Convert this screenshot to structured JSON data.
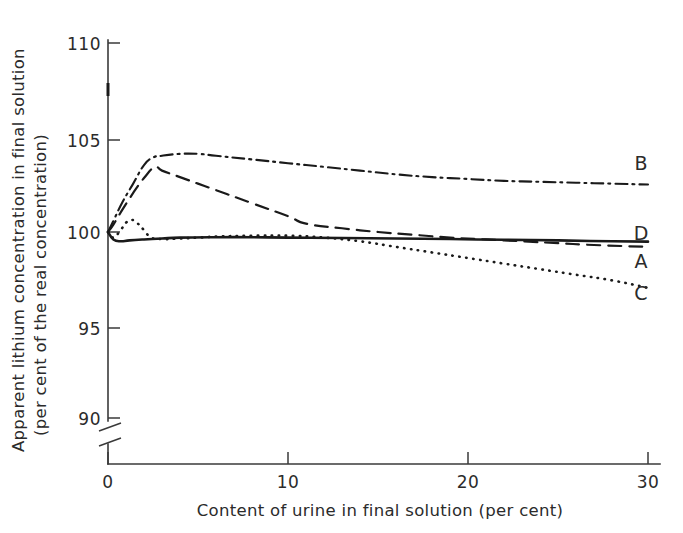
{
  "chart_data": {
    "type": "line",
    "title": "",
    "xlabel": "Content of urine in final solution (per cent)",
    "ylabel_line1": "Apparent lithium concentration in final solution",
    "ylabel_line2": "(per cent of the real concentration)",
    "xlim": [
      0,
      30
    ],
    "ylim": [
      90,
      110
    ],
    "xticks": [
      0,
      10,
      20,
      30
    ],
    "xticklabels": [
      "0",
      "10",
      "20",
      "30"
    ],
    "yticks": [
      90,
      95,
      100,
      105,
      110
    ],
    "yticklabels": [
      "90",
      "95",
      "100",
      "105",
      "110"
    ],
    "y_axis_break": true,
    "y_axis_break_note": "axis broken between 0 and 90",
    "grid": false,
    "legend_position": "right-inline-end-labels",
    "series": [
      {
        "name": "B",
        "label": "B",
        "style": "dash-dot",
        "label_value": 103.1,
        "x": [
          0,
          0.3,
          0.8,
          1.4,
          2.0,
          2.5,
          3.0,
          4.0,
          5.0,
          6.0,
          8.0,
          10.0,
          12.0,
          14.0,
          16.0,
          18.0,
          20.0,
          22.0,
          24.0,
          26.0,
          28.0,
          30.0
        ],
        "y": [
          100.0,
          100.6,
          101.6,
          102.6,
          103.6,
          104.0,
          104.1,
          104.2,
          104.2,
          104.1,
          103.9,
          103.7,
          103.5,
          103.3,
          103.1,
          102.95,
          102.85,
          102.75,
          102.7,
          102.65,
          102.6,
          102.55
        ]
      },
      {
        "name": "A",
        "label": "A",
        "style": "dashed",
        "label_value": 98.6,
        "x": [
          0,
          0.3,
          0.8,
          1.4,
          2.0,
          2.6,
          3.0,
          4.0,
          5.0,
          6.0,
          8.0,
          10.0,
          11.0,
          13.0,
          15.0,
          17.0,
          19.0,
          21.0,
          23.0,
          25.0,
          27.0,
          30.0
        ],
        "y": [
          100.0,
          100.4,
          101.2,
          102.1,
          102.9,
          103.5,
          103.3,
          102.95,
          102.6,
          102.25,
          101.55,
          100.85,
          100.45,
          100.2,
          100.0,
          99.85,
          99.7,
          99.6,
          99.5,
          99.4,
          99.3,
          99.2
        ]
      },
      {
        "name": "D",
        "label": "D",
        "style": "solid",
        "label_value": 100.3,
        "x": [
          0,
          0.3,
          0.7,
          1.2,
          2.0,
          3.0,
          4.0,
          6.0,
          8.0,
          10.0,
          13.0,
          16.0,
          19.0,
          22.0,
          25.0,
          28.0,
          30.0
        ],
        "y": [
          100.0,
          99.6,
          99.5,
          99.55,
          99.6,
          99.65,
          99.7,
          99.72,
          99.72,
          99.7,
          99.68,
          99.65,
          99.62,
          99.58,
          99.55,
          99.5,
          99.48
        ]
      },
      {
        "name": "C",
        "label": "C",
        "style": "dotted",
        "label_value": 96.2,
        "x": [
          0,
          0.3,
          0.7,
          1.0,
          1.3,
          1.6,
          2.0,
          2.4,
          3.0,
          4.0,
          5.0,
          6.0,
          8.0,
          10.0,
          12.0,
          14.0,
          16.0,
          18.0,
          20.0,
          22.0,
          24.0,
          26.0,
          28.0,
          30.0
        ],
        "y": [
          100.0,
          99.7,
          100.1,
          100.5,
          100.65,
          100.5,
          100.1,
          99.7,
          99.62,
          99.65,
          99.7,
          99.75,
          99.8,
          99.8,
          99.7,
          99.5,
          99.2,
          98.9,
          98.6,
          98.3,
          98.0,
          97.7,
          97.4,
          97.0
        ]
      }
    ],
    "annotations": [
      {
        "name": "axis-point-mark",
        "description": "short thick tick mark on y-axis near 108",
        "x": 0,
        "y": 108.1
      }
    ]
  }
}
